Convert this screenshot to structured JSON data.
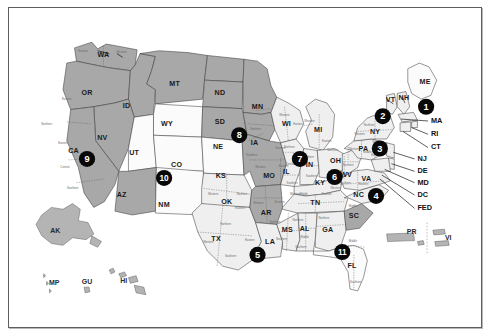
{
  "map": {
    "title": "United States regional map with numbered markers",
    "colors": {
      "frame_border": "#5e5e5e",
      "state_dark": "#a8a8a8",
      "state_mid": "#c4c4c4",
      "state_light": "#efefef",
      "state_white": "#fbfbfb",
      "marker_fill": "#080808",
      "marker_text": "#ffffff",
      "background": "#ffffff"
    },
    "states": [
      {
        "code": "WA",
        "x": 98,
        "y": 50,
        "shade": "dark"
      },
      {
        "code": "OR",
        "x": 81,
        "y": 90,
        "shade": "dark"
      },
      {
        "code": "ID",
        "x": 122,
        "y": 103,
        "shade": "dark"
      },
      {
        "code": "MT",
        "x": 172,
        "y": 80,
        "shade": "dark"
      },
      {
        "code": "ND",
        "x": 219,
        "y": 90,
        "shade": "dark"
      },
      {
        "code": "SD",
        "x": 219,
        "y": 120,
        "shade": "dark"
      },
      {
        "code": "MN",
        "x": 258,
        "y": 104,
        "shade": "dark"
      },
      {
        "code": "WY",
        "x": 164,
        "y": 122,
        "shade": "white"
      },
      {
        "code": "NE",
        "x": 217,
        "y": 147,
        "shade": "dark"
      },
      {
        "code": "NV",
        "x": 97,
        "y": 137,
        "shade": "dark"
      },
      {
        "code": "CA",
        "x": 67,
        "y": 151,
        "shade": "dark"
      },
      {
        "code": "UT",
        "x": 130,
        "y": 153,
        "shade": "white"
      },
      {
        "code": "CO",
        "x": 174,
        "y": 166,
        "shade": "white"
      },
      {
        "code": "KS",
        "x": 220,
        "y": 177,
        "shade": "white"
      },
      {
        "code": "AZ",
        "x": 117,
        "y": 197,
        "shade": "dark"
      },
      {
        "code": "NM",
        "x": 161,
        "y": 208,
        "shade": "white"
      },
      {
        "code": "OK",
        "x": 226,
        "y": 205,
        "shade": "light"
      },
      {
        "code": "TX",
        "x": 215,
        "y": 243,
        "shade": "light"
      },
      {
        "code": "IA",
        "x": 255,
        "y": 142,
        "shade": "dark"
      },
      {
        "code": "MO",
        "x": 270,
        "y": 177,
        "shade": "dark"
      },
      {
        "code": "AR",
        "x": 267,
        "y": 216,
        "shade": "dark"
      },
      {
        "code": "LA",
        "x": 271,
        "y": 247,
        "shade": "light"
      },
      {
        "code": "WI",
        "x": 288,
        "y": 122,
        "shade": "light"
      },
      {
        "code": "MI",
        "x": 321,
        "y": 129,
        "shade": "light"
      },
      {
        "code": "IL",
        "x": 288,
        "y": 173,
        "shade": "light"
      },
      {
        "code": "IN",
        "x": 312,
        "y": 166,
        "shade": "light"
      },
      {
        "code": "OH",
        "x": 339,
        "y": 161,
        "shade": "light"
      },
      {
        "code": "KY",
        "x": 323,
        "y": 184,
        "shade": "light"
      },
      {
        "code": "TN",
        "x": 318,
        "y": 206,
        "shade": "light"
      },
      {
        "code": "MS",
        "x": 289,
        "y": 234,
        "shade": "light"
      },
      {
        "code": "AL",
        "x": 307,
        "y": 233,
        "shade": "light"
      },
      {
        "code": "GA",
        "x": 331,
        "y": 234,
        "shade": "light"
      },
      {
        "code": "FL",
        "x": 356,
        "y": 272,
        "shade": "white"
      },
      {
        "code": "SC",
        "x": 358,
        "y": 219,
        "shade": "dark"
      },
      {
        "code": "NC",
        "x": 363,
        "y": 197,
        "shade": "light"
      },
      {
        "code": "VA",
        "x": 371,
        "y": 180,
        "shade": "light"
      },
      {
        "code": "WV",
        "x": 350,
        "y": 176,
        "shade": "light"
      },
      {
        "code": "PA",
        "x": 368,
        "y": 149,
        "shade": "light"
      },
      {
        "code": "NY",
        "x": 380,
        "y": 131,
        "shade": "light"
      },
      {
        "code": "VT",
        "x": 396,
        "y": 97,
        "shade": "light"
      },
      {
        "code": "NH",
        "x": 410,
        "y": 95,
        "shade": "light"
      },
      {
        "code": "ME",
        "x": 432,
        "y": 78,
        "shade": "white"
      }
    ],
    "callouts": [
      {
        "label": "MA",
        "x": 438,
        "y": 119
      },
      {
        "label": "RI",
        "x": 438,
        "y": 133
      },
      {
        "label": "CT",
        "x": 438,
        "y": 147
      },
      {
        "label": "NJ",
        "x": 424,
        "y": 159
      },
      {
        "label": "DE",
        "x": 424,
        "y": 172
      },
      {
        "label": "MD",
        "x": 424,
        "y": 184
      },
      {
        "label": "DC",
        "x": 424,
        "y": 197
      },
      {
        "label": "FED",
        "x": 424,
        "y": 211
      }
    ],
    "territories": [
      {
        "code": "AK",
        "x": 48,
        "y": 235
      },
      {
        "code": "MP",
        "x": 47,
        "y": 290
      },
      {
        "code": "GU",
        "x": 81,
        "y": 289
      },
      {
        "code": "HI",
        "x": 119,
        "y": 288
      },
      {
        "code": "PR",
        "x": 418,
        "y": 236
      },
      {
        "code": "VI",
        "x": 456,
        "y": 243
      }
    ],
    "markers": [
      {
        "number": "1",
        "x": 433,
        "y": 104
      },
      {
        "number": "2",
        "x": 388,
        "y": 114
      },
      {
        "number": "3",
        "x": 385,
        "y": 148
      },
      {
        "number": "4",
        "x": 381,
        "y": 198
      },
      {
        "number": "5",
        "x": 258,
        "y": 260
      },
      {
        "number": "6",
        "x": 338,
        "y": 178
      },
      {
        "number": "7",
        "x": 302,
        "y": 159
      },
      {
        "number": "8",
        "x": 239,
        "y": 134
      },
      {
        "number": "9",
        "x": 81,
        "y": 159
      },
      {
        "number": "10",
        "x": 161,
        "y": 179
      },
      {
        "number": "11",
        "x": 346,
        "y": 257
      }
    ],
    "subregions": [
      {
        "label": "Eastern",
        "x": 77,
        "y": 46
      },
      {
        "label": "Western",
        "x": 117,
        "y": 47
      },
      {
        "label": "Eastern",
        "x": 60,
        "y": 96
      },
      {
        "label": "Northern",
        "x": 39,
        "y": 122
      },
      {
        "label": "Eastern",
        "x": 56,
        "y": 142
      },
      {
        "label": "Central",
        "x": 58,
        "y": 168
      },
      {
        "label": "Southern",
        "x": 66,
        "y": 190
      },
      {
        "label": "Northern",
        "x": 256,
        "y": 128
      },
      {
        "label": "Southern",
        "x": 252,
        "y": 155
      },
      {
        "label": "Western",
        "x": 261,
        "y": 168
      },
      {
        "label": "Eastern",
        "x": 285,
        "y": 167
      },
      {
        "label": "Eastern",
        "x": 282,
        "y": 148
      },
      {
        "label": "Western",
        "x": 212,
        "y": 196
      },
      {
        "label": "Northern",
        "x": 242,
        "y": 196
      },
      {
        "label": "Eastern",
        "x": 240,
        "y": 211
      },
      {
        "label": "Northern",
        "x": 225,
        "y": 228
      },
      {
        "label": "Western",
        "x": 207,
        "y": 247
      },
      {
        "label": "Southern",
        "x": 230,
        "y": 262
      },
      {
        "label": "Eastern",
        "x": 250,
        "y": 245
      },
      {
        "label": "Western",
        "x": 259,
        "y": 206
      },
      {
        "label": "Eastern",
        "x": 281,
        "y": 205
      },
      {
        "label": "Northern",
        "x": 276,
        "y": 226
      },
      {
        "label": "Southern",
        "x": 283,
        "y": 244
      },
      {
        "label": "Northern",
        "x": 300,
        "y": 224
      },
      {
        "label": "Middle",
        "x": 307,
        "y": 242
      },
      {
        "label": "Southern",
        "x": 303,
        "y": 252
      },
      {
        "label": "Northern",
        "x": 327,
        "y": 222
      },
      {
        "label": "Middle",
        "x": 306,
        "y": 196
      },
      {
        "label": "Eastern",
        "x": 330,
        "y": 196
      },
      {
        "label": "Western",
        "x": 297,
        "y": 196
      },
      {
        "label": "Middle",
        "x": 357,
        "y": 246
      },
      {
        "label": "Southern",
        "x": 360,
        "y": 289
      },
      {
        "label": "Western",
        "x": 339,
        "y": 190
      },
      {
        "label": "Eastern",
        "x": 368,
        "y": 186
      },
      {
        "label": "Middle",
        "x": 357,
        "y": 209
      },
      {
        "label": "Northern",
        "x": 352,
        "y": 166
      },
      {
        "label": "Southern",
        "x": 349,
        "y": 185
      },
      {
        "label": "Northern",
        "x": 336,
        "y": 150
      },
      {
        "label": "Southern",
        "x": 340,
        "y": 172
      },
      {
        "label": "Western",
        "x": 358,
        "y": 149
      },
      {
        "label": "Middle",
        "x": 372,
        "y": 152
      },
      {
        "label": "Eastern",
        "x": 381,
        "y": 155
      },
      {
        "label": "Northern",
        "x": 374,
        "y": 124
      },
      {
        "label": "Western",
        "x": 364,
        "y": 133
      },
      {
        "label": "Southern",
        "x": 383,
        "y": 141
      },
      {
        "label": "Western",
        "x": 286,
        "y": 113
      },
      {
        "label": "Eastern",
        "x": 300,
        "y": 122
      },
      {
        "label": "Western",
        "x": 312,
        "y": 119
      },
      {
        "label": "Eastern",
        "x": 330,
        "y": 140
      },
      {
        "label": "Northern",
        "x": 291,
        "y": 147
      },
      {
        "label": "Central",
        "x": 292,
        "y": 165
      },
      {
        "label": "Southern",
        "x": 294,
        "y": 185
      },
      {
        "label": "Northern",
        "x": 311,
        "y": 157
      },
      {
        "label": "Southern",
        "x": 314,
        "y": 177
      }
    ]
  }
}
